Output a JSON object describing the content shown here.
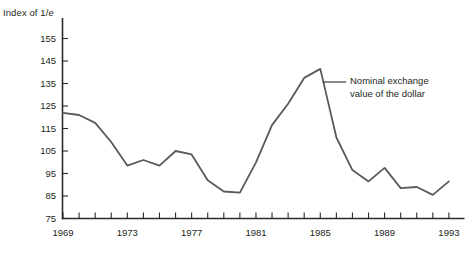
{
  "figure": {
    "background": "#ffffff",
    "axis_title": {
      "prefix": "Index of 1/",
      "italic": "e"
    },
    "annotation": {
      "line1": "Nominal exchange",
      "line2": "value of the dollar"
    }
  },
  "chart_data": {
    "type": "line",
    "title": "",
    "ylabel": "Index of 1/e",
    "xlabel": "",
    "grid": false,
    "legend_position": "none",
    "annotation_text": "Nominal exchange value of the dollar",
    "xlim": [
      1969,
      1993
    ],
    "ylim": [
      75,
      155
    ],
    "y_ticks": [
      75,
      85,
      95,
      105,
      115,
      125,
      135,
      145,
      155
    ],
    "x_tick_every": 1,
    "x_labeled_ticks": [
      1969,
      1973,
      1977,
      1981,
      1985,
      1989,
      1993
    ],
    "series": [
      {
        "name": "Nominal exchange value of the dollar",
        "x": [
          1969,
          1970,
          1971,
          1972,
          1973,
          1974,
          1975,
          1976,
          1977,
          1978,
          1979,
          1980,
          1981,
          1982,
          1983,
          1984,
          1985,
          1986,
          1987,
          1988,
          1989,
          1990,
          1991,
          1992,
          1993
        ],
        "values": [
          122,
          121,
          117.5,
          109,
          98.5,
          101,
          98.5,
          105,
          103.5,
          92,
          87,
          86.5,
          100,
          116.5,
          126,
          137.5,
          141.5,
          111,
          96.5,
          91.5,
          97.5,
          88.5,
          89,
          85.5,
          91.5
        ]
      }
    ],
    "colors": {
      "line": "#595a5c",
      "axis": "#2b2a2c",
      "text": "#231f20"
    }
  }
}
